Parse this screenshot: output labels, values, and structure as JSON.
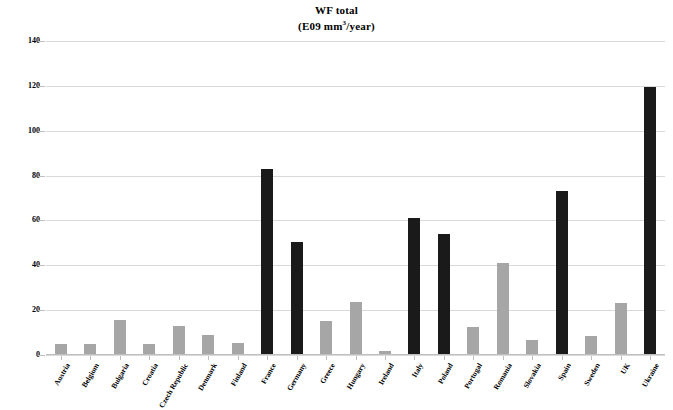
{
  "chart_data": {
    "type": "bar",
    "title": "WF total",
    "subtitle": "(E09 mm³/year)",
    "title_line1": "WF total",
    "title_line2_prefix": "(E09 mm",
    "title_line2_sup": "3",
    "title_line2_suffix": "/year)",
    "xlabel": "",
    "ylabel": "",
    "ylim": [
      0,
      140
    ],
    "ytick_values": [
      0,
      20,
      40,
      60,
      80,
      100,
      120,
      140
    ],
    "ytick_labels": [
      "0",
      "20",
      "40",
      "60",
      "80",
      "100",
      "120",
      "140"
    ],
    "grid": true,
    "legend": null,
    "categories": [
      "Austria",
      "Belgium",
      "Bulgaria",
      "Croatia",
      "Czech Republic",
      "Denmark",
      "Finland",
      "France",
      "Germany",
      "Greece",
      "Hungary",
      "Ireland",
      "Italy",
      "Poland",
      "Portugal",
      "Romania",
      "Slovakia",
      "Spain",
      "Sweden",
      "UK",
      "Ukraine"
    ],
    "values": [
      5,
      5,
      15.5,
      5,
      13,
      9,
      5.5,
      83,
      50.5,
      15,
      23.5,
      2,
      61,
      54,
      12.5,
      41,
      6.5,
      73,
      8.5,
      23,
      119.5
    ],
    "bar_shades": [
      "light",
      "light",
      "light",
      "light",
      "light",
      "light",
      "light",
      "dark",
      "dark",
      "light",
      "light",
      "light",
      "dark",
      "dark",
      "light",
      "light",
      "light",
      "dark",
      "light",
      "light",
      "dark"
    ],
    "colors": {
      "light_bar": "#a6a6a6",
      "dark_bar": "#1a1a1a",
      "gridline": "#d9d9d9",
      "background": "#ffffff",
      "text": "#000000"
    }
  }
}
